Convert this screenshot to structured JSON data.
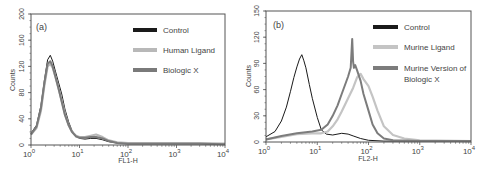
{
  "chart_data": [
    {
      "type": "line",
      "panel_label": "(a)",
      "title": "",
      "xlabel": "FL1-H",
      "ylabel": "Counts",
      "xscale": "log",
      "xlim": [
        1,
        10000
      ],
      "ylim": [
        0,
        200
      ],
      "xticks": [
        "10^0",
        "10^1",
        "10^2",
        "10^3",
        "10^4"
      ],
      "yticks": [
        0,
        40,
        80,
        120,
        160,
        200
      ],
      "grid": false,
      "legend_position": "upper right",
      "series": [
        {
          "name": "Control",
          "color": "#1a1a1a",
          "width": 1,
          "x": [
            1,
            1.3,
            1.6,
            1.9,
            2.2,
            2.5,
            2.8,
            3.2,
            3.7,
            4.3,
            5,
            6,
            7,
            8.5,
            10,
            13,
            17,
            22,
            30,
            40,
            60,
            100,
            300,
            1000,
            3000,
            10000
          ],
          "y": [
            18,
            30,
            60,
            100,
            130,
            137,
            128,
            112,
            95,
            78,
            55,
            35,
            22,
            14,
            10,
            9,
            10,
            10,
            8,
            5,
            3,
            2,
            2,
            2,
            2,
            1
          ]
        },
        {
          "name": "Human Ligand",
          "color": "#b8b8b8",
          "width": 2.2,
          "x": [
            1,
            1.3,
            1.6,
            1.9,
            2.2,
            2.5,
            2.8,
            3.2,
            3.7,
            4.3,
            5,
            6,
            7,
            8.5,
            10,
            13,
            17,
            22,
            30,
            40,
            60,
            100,
            300,
            1000,
            3000,
            10000
          ],
          "y": [
            16,
            26,
            52,
            92,
            120,
            124,
            118,
            104,
            86,
            68,
            48,
            30,
            20,
            14,
            12,
            12,
            14,
            16,
            12,
            7,
            4,
            3,
            3,
            3,
            3,
            2
          ]
        },
        {
          "name": "Biologic X",
          "color": "#7a7a7a",
          "width": 2,
          "x": [
            1,
            1.3,
            1.6,
            1.9,
            2.2,
            2.5,
            2.8,
            3.2,
            3.7,
            4.3,
            5,
            6,
            7,
            8.5,
            10,
            13,
            17,
            22,
            30,
            40,
            60,
            100,
            300,
            1000,
            3000,
            10000
          ],
          "y": [
            16,
            28,
            56,
            96,
            124,
            128,
            120,
            104,
            86,
            66,
            46,
            30,
            20,
            13,
            11,
            11,
            12,
            12,
            10,
            6,
            3,
            2,
            2,
            2,
            2,
            1
          ]
        }
      ]
    },
    {
      "type": "line",
      "panel_label": "(b)",
      "title": "",
      "xlabel": "FL2-H",
      "ylabel": "Counts",
      "xscale": "log",
      "xlim": [
        1,
        10000
      ],
      "ylim": [
        0,
        150
      ],
      "xticks": [
        "10^0",
        "10^1",
        "10^2",
        "10^3",
        "10^4"
      ],
      "yticks": [
        0,
        30,
        60,
        90,
        120,
        150
      ],
      "grid": false,
      "legend_position": "upper right",
      "series": [
        {
          "name": "Control",
          "color": "#1a1a1a",
          "width": 1,
          "x": [
            1,
            1.5,
            2,
            2.5,
            3,
            3.5,
            4,
            4.5,
            5,
            5.5,
            6,
            7,
            8,
            10,
            12,
            15,
            20,
            30,
            40,
            50,
            70,
            100,
            200,
            1000,
            10000
          ],
          "y": [
            6,
            12,
            24,
            40,
            58,
            74,
            86,
            95,
            100,
            93,
            85,
            66,
            50,
            28,
            14,
            9,
            8,
            10,
            9,
            7,
            4,
            2,
            1,
            1,
            1
          ]
        },
        {
          "name": "Murine Ligand",
          "color": "#c4c4c4",
          "width": 2.2,
          "x": [
            1,
            2,
            4,
            8,
            12,
            16,
            20,
            25,
            30,
            40,
            50,
            60,
            70,
            80,
            100,
            120,
            150,
            200,
            300,
            500,
            1000,
            10000
          ],
          "y": [
            3,
            6,
            9,
            10,
            10,
            12,
            18,
            26,
            35,
            50,
            62,
            74,
            78,
            72,
            64,
            52,
            36,
            18,
            8,
            4,
            2,
            1
          ]
        },
        {
          "name": "Murine Version of Biologic X",
          "color": "#7c7c7c",
          "width": 2,
          "x": [
            1,
            2,
            4,
            8,
            12,
            16,
            20,
            25,
            30,
            40,
            45,
            48,
            50,
            52,
            55,
            60,
            70,
            80,
            100,
            120,
            150,
            200,
            300,
            1000,
            10000
          ],
          "y": [
            3,
            7,
            10,
            12,
            14,
            20,
            30,
            42,
            55,
            75,
            85,
            118,
            92,
            85,
            88,
            82,
            70,
            55,
            36,
            20,
            10,
            4,
            2,
            1,
            1
          ]
        }
      ]
    }
  ],
  "panels": [
    {
      "label": "(a)",
      "xlabel": "FL1-H",
      "ylabel": "Counts",
      "legend": [
        "Control",
        "Human Ligand",
        "Biologic X"
      ]
    },
    {
      "label": "(b)",
      "xlabel": "FL2-H",
      "ylabel": "Counts",
      "legend": [
        "Control",
        "Murine Ligand",
        "Murine Version of",
        "Biologic X"
      ]
    }
  ]
}
